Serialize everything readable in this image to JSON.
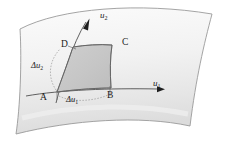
{
  "figure": {
    "background_color": "#ffffff",
    "surface_fill_top": "#f7f7f7",
    "surface_fill_bottom": "#e4e4e4",
    "surface_stroke": "#8c8c8c",
    "patch_fill": "#c6c6c6",
    "patch_stroke": "#6e6e6e",
    "curve_stroke": "#4a4a4a",
    "label_color": "#1b1b1b"
  },
  "labels": {
    "axis_u1": "u",
    "axis_u1_sub": "1",
    "axis_u2": "u",
    "axis_u2_sub": "2",
    "delta_u1_sym": "Δu",
    "delta_u1_sub": "1",
    "delta_u2_sym": "Δu",
    "delta_u2_sub": "2",
    "point_a": "A",
    "point_b": "B",
    "point_c": "C",
    "point_d": "D"
  }
}
